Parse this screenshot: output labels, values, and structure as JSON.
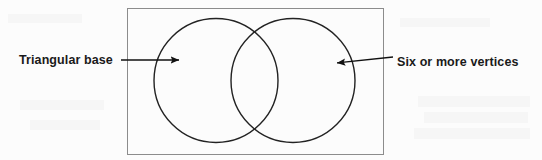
{
  "figure": {
    "type": "venn-diagram",
    "title": "",
    "background_color": "#fcfcfc",
    "frame": {
      "name": "universal-set-rectangle",
      "x": 127,
      "y": 8,
      "width": 257,
      "height": 147,
      "stroke_color": "#8c8c8c",
      "stroke_width": 1,
      "fill": "none"
    },
    "circles": [
      {
        "name": "left-set-circle",
        "label": "Triangular base",
        "cx": 216,
        "cy": 80.5,
        "r": 62,
        "stroke_color": "#222222",
        "stroke_width": 1.4,
        "fill": "none"
      },
      {
        "name": "right-set-circle",
        "label": "Six or more vertices",
        "cx": 293,
        "cy": 80.5,
        "r": 62,
        "stroke_color": "#222222",
        "stroke_width": 1.4,
        "fill": "none"
      }
    ],
    "annotations": [
      {
        "name": "left-annotation",
        "text": "Triangular base",
        "text_x": 19,
        "text_y": 54,
        "arrow": {
          "name": "left-arrow",
          "x1": 121,
          "y1": 60,
          "x2": 180,
          "y2": 60,
          "direction": "right",
          "color": "#111111",
          "stroke_width": 1.4
        }
      },
      {
        "name": "right-annotation",
        "text": "Six or more vertices",
        "text_x": 397,
        "text_y": 56,
        "arrow": {
          "name": "right-arrow",
          "x1": 393,
          "y1": 57,
          "x2": 336,
          "y2": 63,
          "direction": "left",
          "color": "#111111",
          "stroke_width": 1.4
        }
      }
    ],
    "colors": {
      "ink": "#1a1a1a",
      "circle_stroke": "#222222",
      "frame_stroke": "#8c8c8c",
      "background": "#fcfcfc"
    }
  }
}
